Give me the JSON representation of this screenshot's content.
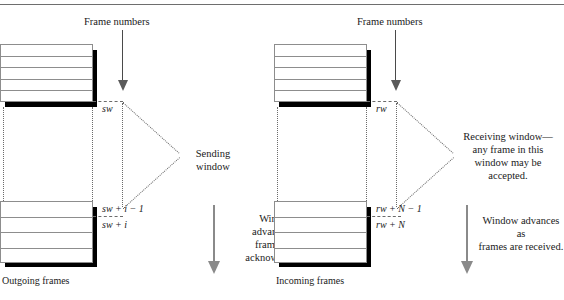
{
  "diagram": {
    "type": "networking-protocol-diagram"
  },
  "left": {
    "header_label": "Frame numbers",
    "window_pointer_top": "sw",
    "window_pointer_mid": "sw + i − 1",
    "window_pointer_bottom": "sw + i",
    "window_name_line1": "Sending",
    "window_name_line2": "window",
    "advance_note": "Window\nadvances as\nframes are\nacknowledged.",
    "advance_note_line1": "Window",
    "advance_note_line2": "advances as",
    "advance_note_line3": "frames are",
    "advance_note_line4": "acknowledged.",
    "caption": "Outgoing frames",
    "top_stack_rows": 5,
    "bottom_stack_rows": 4
  },
  "right": {
    "header_label": "Frame numbers",
    "window_pointer_top": "rw",
    "window_pointer_mid": "rw + N − 1",
    "window_pointer_bottom": "rw + N",
    "window_note_line1": "Receiving window—",
    "window_note_line2": "any frame in this",
    "window_note_line3": "window may be",
    "window_note_line4": "accepted.",
    "advance_note_line1": "Window advances as",
    "advance_note_line2": "frames are received.",
    "caption": "Incoming frames",
    "top_stack_rows": 5,
    "bottom_stack_rows": 4
  },
  "colors": {
    "line": "#8d8d8d",
    "shadow": "#000000",
    "dotted": "#6b6b6b",
    "arrow": "#5a5a5a",
    "arrow_light": "#8a8a8a",
    "text": "#1a1a1a",
    "background": "#ffffff"
  },
  "icons": {
    "down_arrow": "down-arrow-icon"
  }
}
